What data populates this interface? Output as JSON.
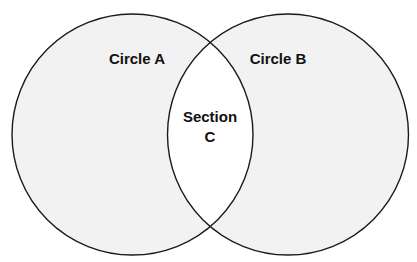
{
  "diagram": {
    "type": "venn",
    "colors": {
      "background": "#ffffff",
      "circle_fill": "#f2f2f2",
      "intersection_fill": "#ffffff",
      "stroke": "#1a1a1a",
      "text": "#111111"
    },
    "circles": [
      {
        "id": "A",
        "label": "Circle A",
        "cx": 132.5,
        "cy": 134.5,
        "r": 120.5
      },
      {
        "id": "B",
        "label": "Circle B",
        "cx": 288,
        "cy": 134.5,
        "r": 120.5
      }
    ],
    "intersection": {
      "label_line1": "Section",
      "label_line2": "C"
    }
  }
}
